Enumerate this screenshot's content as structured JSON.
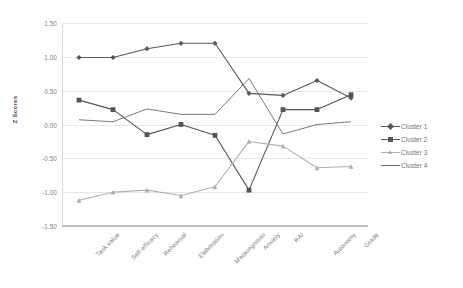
{
  "chart_data": {
    "type": "line",
    "title": "",
    "xlabel": "",
    "ylabel": "Z Scores",
    "ylim": [
      -1.5,
      1.5
    ],
    "yticks": [
      "1.50",
      "1.00",
      "0.50",
      "0.00",
      "-0.50",
      "-1.00",
      "-1.50"
    ],
    "ytick_values": [
      1.5,
      1.0,
      0.5,
      0.0,
      -0.5,
      -1.0,
      -1.5
    ],
    "grid": true,
    "legend_position": "right",
    "categories": [
      "Task value",
      "Self-efficacy",
      "Rehearsal",
      "Elaboration",
      "Metacognition",
      "Anxiety",
      "RAI",
      "Autonomy",
      "Grade"
    ],
    "series": [
      {
        "name": "Cluster 1",
        "marker": "diamond",
        "color": "#595959",
        "values": [
          0.99,
          0.99,
          1.12,
          1.2,
          1.2,
          0.46,
          0.43,
          0.65,
          0.39
        ]
      },
      {
        "name": "Cluster 2",
        "marker": "square",
        "color": "#555555",
        "values": [
          0.36,
          0.22,
          -0.15,
          0.0,
          -0.16,
          -0.97,
          0.22,
          0.22,
          0.44
        ]
      },
      {
        "name": "Cluster 3",
        "marker": "triangle",
        "color": "#b0b0b0",
        "values": [
          -1.12,
          -1.0,
          -0.97,
          -1.05,
          -0.92,
          -0.25,
          -0.32,
          -0.64,
          -0.62
        ]
      },
      {
        "name": "Cluster 4",
        "marker": "none",
        "color": "#6b6b6b",
        "values": [
          0.07,
          0.04,
          0.23,
          0.15,
          0.15,
          0.68,
          -0.14,
          0.0,
          0.04
        ]
      }
    ]
  },
  "legend": {
    "items": [
      {
        "label": "Cluster 1"
      },
      {
        "label": "Cluster 2"
      },
      {
        "label": "Cluster 3"
      },
      {
        "label": "Cluster 4"
      }
    ]
  }
}
